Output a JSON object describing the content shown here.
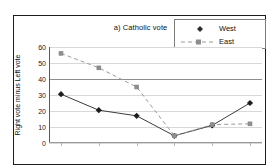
{
  "chart_data": {
    "type": "line",
    "title": "a) Catholic vote",
    "xlabel": "",
    "ylabel": "Right vote minus Left vote",
    "ylim": [
      0,
      60
    ],
    "yticks": [
      0,
      10,
      20,
      30,
      40,
      50,
      60
    ],
    "grid": true,
    "legend_position": "top-right",
    "x": [
      1,
      2,
      3,
      4,
      5,
      6
    ],
    "categories": [
      "",
      "",
      "",
      "",
      "",
      ""
    ],
    "series": [
      {
        "name": "West",
        "marker": "filled-diamond",
        "linestyle": "solid",
        "color": "#3c3c3c",
        "values": [
          30.5,
          20.5,
          17.0,
          4.5,
          11.0,
          25.0
        ]
      },
      {
        "name": "East",
        "marker": "filled-square",
        "linestyle": "dashed",
        "color": "#9a9a9a",
        "values": [
          56.0,
          47.0,
          35.0,
          4.5,
          11.5,
          12.0
        ]
      }
    ]
  },
  "figure": {
    "title": "a) Catholic vote",
    "y_axis_title": "Right vote minus Left vote",
    "y_tick_labels": [
      "60",
      "50",
      "40",
      "30",
      "20",
      "10",
      "0"
    ],
    "legend": {
      "west_label": "West",
      "east_label": "East"
    }
  }
}
